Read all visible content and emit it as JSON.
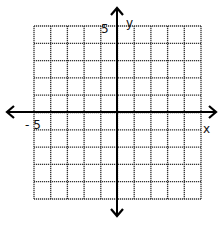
{
  "diagram": {
    "type": "coordinate-grid",
    "x_axis_label": "x",
    "y_axis_label": "y",
    "x_min_label": "- 5",
    "y_max_label": "5",
    "x_range": [
      -5,
      5
    ],
    "y_range": [
      -5,
      5
    ],
    "grid_cells_x": 10,
    "grid_cells_y": 10,
    "grid_style": "dotted",
    "axis_color": "#000000",
    "grid_color": "#333333"
  }
}
